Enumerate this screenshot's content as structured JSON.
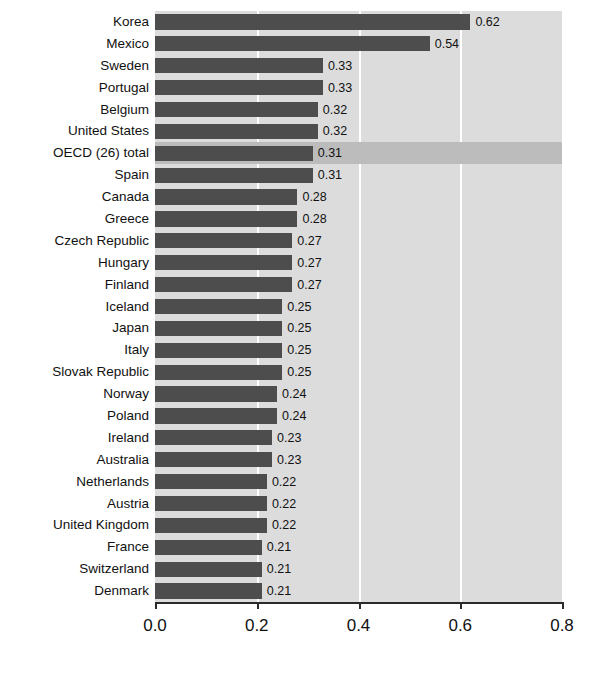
{
  "chart_data": {
    "type": "bar",
    "orientation": "horizontal",
    "title": "",
    "xlabel": "",
    "ylabel": "",
    "xlim": [
      0.0,
      0.8
    ],
    "xticks": [
      "0.0",
      "0.2",
      "0.4",
      "0.6",
      "0.8"
    ],
    "xtick_values": [
      0.0,
      0.2,
      0.4,
      0.6,
      0.8
    ],
    "gridlines": [
      0.2,
      0.4,
      0.6
    ],
    "grid": true,
    "legend": "none",
    "value_label_format": "0.00",
    "highlight_category": "OECD (26) total",
    "categories": [
      "Korea",
      "Mexico",
      "Sweden",
      "Portugal",
      "Belgium",
      "United States",
      "OECD (26) total",
      "Spain",
      "Canada",
      "Greece",
      "Czech Republic",
      "Hungary",
      "Finland",
      "Iceland",
      "Japan",
      "Italy",
      "Slovak Republic",
      "Norway",
      "Poland",
      "Ireland",
      "Australia",
      "Netherlands",
      "Austria",
      "United Kingdom",
      "France",
      "Switzerland",
      "Denmark"
    ],
    "values": [
      0.62,
      0.54,
      0.33,
      0.33,
      0.32,
      0.32,
      0.31,
      0.31,
      0.28,
      0.28,
      0.27,
      0.27,
      0.27,
      0.25,
      0.25,
      0.25,
      0.25,
      0.24,
      0.24,
      0.23,
      0.23,
      0.22,
      0.22,
      0.22,
      0.21,
      0.21,
      0.21
    ],
    "value_labels": [
      "0.62",
      "0.54",
      "0.33",
      "0.33",
      "0.32",
      "0.32",
      "0.31",
      "0.31",
      "0.28",
      "0.28",
      "0.27",
      "0.27",
      "0.27",
      "0.25",
      "0.25",
      "0.25",
      "0.25",
      "0.24",
      "0.24",
      "0.23",
      "0.23",
      "0.22",
      "0.22",
      "0.22",
      "0.21",
      "0.21",
      "0.21"
    ]
  },
  "colors": {
    "bar": "#4d4d4d",
    "plot_background": "#dcdcdc",
    "highlight_band": "#bcbcbc",
    "gridline": "#ffffff",
    "axis": "#2b2b2b",
    "text": "#111111",
    "page_background": "#ffffff"
  }
}
